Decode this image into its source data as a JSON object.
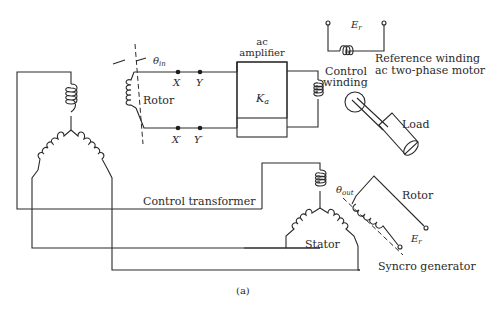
{
  "figure": {
    "caption": "(a)",
    "type": "synchro control system schematic"
  },
  "labels": {
    "theta_in": "θ",
    "theta_in_sub": "in",
    "rotor_left": "Rotor",
    "x": "X",
    "y": "Y",
    "x_prime": "X′",
    "y_prime": "Y′",
    "amplifier_line1": "ac",
    "amplifier_line2": "amplifier",
    "gain": "K",
    "gain_sub": "a",
    "control_winding_line1": "Control",
    "control_winding_line2": "winding",
    "er_top": "E",
    "er_top_sub": "r",
    "reference_winding": "Reference winding",
    "motor": "ac two-phase motor",
    "load": "Load",
    "control_transformer": "Control transformer",
    "theta_out": "θ",
    "theta_out_sub": "out",
    "rotor_right": "Rotor",
    "er_bottom": "E",
    "er_bottom_sub": "r",
    "stator": "Stator",
    "synchro_generator": "Syncro generator"
  },
  "components": [
    {
      "name": "control-transformer-stator",
      "kind": "Y-connected 3 coils"
    },
    {
      "name": "control-transformer-rotor",
      "kind": "coil",
      "angle": "θin"
    },
    {
      "name": "ac-amplifier",
      "gain": "Ka"
    },
    {
      "name": "ac-two-phase-motor",
      "windings": [
        "Control winding",
        "Reference winding"
      ]
    },
    {
      "name": "load"
    },
    {
      "name": "synchro-generator-stator",
      "kind": "Y-connected 3 coils"
    },
    {
      "name": "synchro-generator-rotor",
      "angle": "θout",
      "excitation": "Er"
    }
  ]
}
